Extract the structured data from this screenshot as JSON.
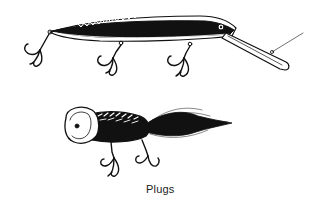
{
  "figure": {
    "caption": "Plugs",
    "items": [
      {
        "name": "minnow-plug",
        "description": "Long slender diving plug with lip and three treble hooks"
      },
      {
        "name": "popper-plug",
        "description": "Short cup-faced popper with feathered tail and two treble hooks"
      }
    ],
    "colors": {
      "ink": "#111111",
      "paper": "#ffffff"
    }
  }
}
